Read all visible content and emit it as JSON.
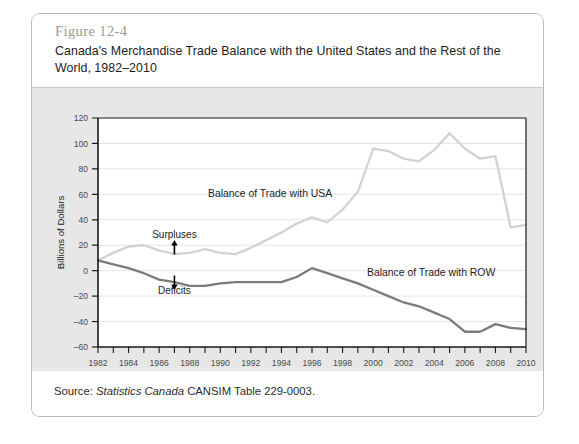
{
  "figure": {
    "number": "Figure 12-4",
    "title": "Canada's Merchandise Trade Balance with the United States and the Rest of the World, 1982–2010",
    "source_prefix": "Source: ",
    "source_em": "Statistics Canada",
    "source_rest": " CANSIM Table 229-0003."
  },
  "colors": {
    "card_border": "#b9b9b9",
    "chart_background": "#e7e7e7",
    "plot_background": "#ffffff",
    "axis": "#1a1a1a",
    "gridline": "#e2e2e2",
    "usa_line": "#d2d2d2",
    "row_line": "#7b7b7b",
    "arrow": "#000000"
  },
  "chart_data": {
    "type": "line",
    "title": "Canada's Merchandise Trade Balance with the United States and the Rest of the World, 1982–2010",
    "xlabel": "Year",
    "ylabel": "Billions of Dollars",
    "xlim": [
      1982,
      2010
    ],
    "ylim": [
      -60,
      120
    ],
    "yticks": [
      -60,
      -40,
      -20,
      0,
      20,
      40,
      60,
      80,
      100,
      120
    ],
    "xticks": [
      1982,
      1983,
      1984,
      1985,
      1986,
      1987,
      1988,
      1989,
      1990,
      1991,
      1992,
      1993,
      1994,
      1995,
      1996,
      1997,
      1998,
      1999,
      2000,
      2001,
      2002,
      2003,
      2004,
      2005,
      2006,
      2007,
      2008,
      2009,
      2010
    ],
    "xtick_labels": [
      1982,
      1984,
      1986,
      1988,
      1990,
      1992,
      1994,
      1996,
      1998,
      2000,
      2002,
      2004,
      2006,
      2008,
      2010
    ],
    "grid": true,
    "legend": "inline-annotations",
    "x": [
      1982,
      1983,
      1984,
      1985,
      1986,
      1987,
      1988,
      1989,
      1990,
      1991,
      1992,
      1993,
      1994,
      1995,
      1996,
      1997,
      1998,
      1999,
      2000,
      2001,
      2002,
      2003,
      2004,
      2005,
      2006,
      2007,
      2008,
      2009,
      2010
    ],
    "series": [
      {
        "name": "Balance of Trade with USA",
        "color": "#d2d2d2",
        "values": [
          8,
          14,
          19,
          20,
          16,
          13,
          14,
          17,
          14,
          13,
          18,
          24,
          30,
          37,
          42,
          38,
          48,
          62,
          96,
          94,
          88,
          86,
          95,
          108,
          96,
          88,
          90,
          34,
          36
        ]
      },
      {
        "name": "Balance of Trade with ROW",
        "color": "#7b7b7b",
        "values": [
          8,
          5,
          2,
          -2,
          -7,
          -9,
          -12,
          -12,
          -10,
          -9,
          -9,
          -9,
          -9,
          -5,
          2,
          -2,
          -6,
          -10,
          -15,
          -20,
          -25,
          -28,
          -33,
          -38,
          -48,
          -48,
          -42,
          -45,
          -46
        ]
      }
    ],
    "annotations": [
      {
        "text": "Balance of Trade with USA",
        "x": 1989.2,
        "y": 58
      },
      {
        "text": "Balance of Trade with ROW",
        "x": 1999.6,
        "y": -4
      },
      {
        "text": "Surpluses",
        "x": 1987.0,
        "y": 26,
        "arrow": "up"
      },
      {
        "text": "Deficits",
        "x": 1987.0,
        "y": -18,
        "arrow": "down"
      }
    ]
  }
}
